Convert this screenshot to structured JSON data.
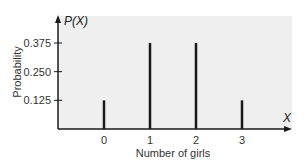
{
  "chart_data": {
    "type": "bar",
    "title": "",
    "xlabel": "Number of girls",
    "ylabel": "Probability",
    "x_axis_symbol": "X",
    "y_axis_symbol": "P(X)",
    "categories": [
      "0",
      "1",
      "2",
      "3"
    ],
    "values": [
      0.125,
      0.375,
      0.375,
      0.125
    ],
    "y_ticks": [
      "0.125",
      "0.250",
      "0.375"
    ],
    "ylim": [
      0,
      0.47
    ],
    "grid": false,
    "legend": null,
    "colors": {
      "background_panel": "#efefef",
      "bars": "#1a1a1a",
      "axes": "#1a1a1a"
    }
  }
}
